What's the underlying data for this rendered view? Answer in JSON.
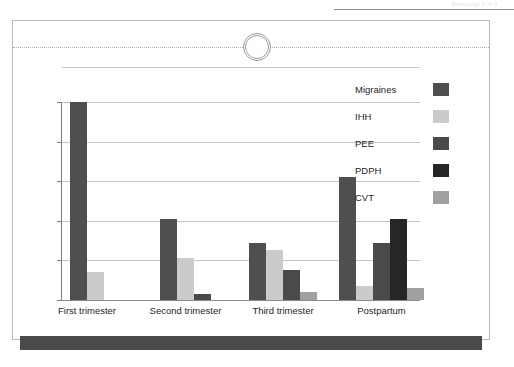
{
  "page": {
    "header_note": "Neurology 2 of 2",
    "background_color": "#ffffff"
  },
  "card": {
    "border_color": "#b9b9b9",
    "tear_marker_name": "perforation-circle"
  },
  "footer": {
    "color": "#4a4a4a"
  },
  "chart_data": {
    "type": "bar",
    "title": "",
    "subtitle": "",
    "xlabel": "",
    "ylabel": "",
    "grid": true,
    "gridlines": 6,
    "ylim": [
      0,
      100
    ],
    "legend_position": "right",
    "categories": [
      "First trimester",
      "Second trimester",
      "Third trimester",
      "Postpartum"
    ],
    "series": [
      {
        "name": "Migraines",
        "color": "#4f4f4f",
        "values": [
          100,
          41,
          29,
          62
        ]
      },
      {
        "name": "IHH",
        "color": "#cbcbcb",
        "values": [
          14,
          21,
          25,
          7
        ]
      },
      {
        "name": "PEE",
        "color": "#4a4a4a",
        "values": [
          0,
          3,
          15,
          29
        ]
      },
      {
        "name": "PDPH",
        "color": "#262626",
        "values": [
          0,
          0,
          0,
          41
        ]
      },
      {
        "name": "CVT",
        "color": "#a0a0a0",
        "values": [
          0,
          0,
          4,
          6
        ]
      }
    ]
  },
  "legend": {
    "items": [
      {
        "label": "Migraines",
        "color": "#4f4f4f"
      },
      {
        "label": "IHH",
        "color": "#cbcbcb"
      },
      {
        "label": "PEE",
        "color": "#4a4a4a"
      },
      {
        "label": "PDPH",
        "color": "#262626"
      },
      {
        "label": "CVT",
        "color": "#a0a0a0"
      }
    ]
  }
}
